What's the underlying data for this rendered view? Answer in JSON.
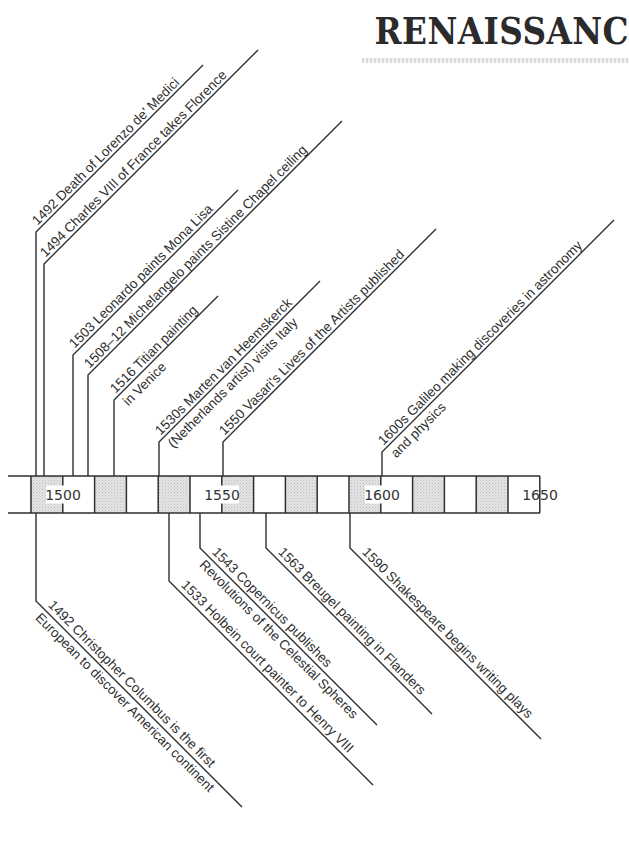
{
  "header": {
    "title": "RENAISSANC"
  },
  "timeline": {
    "start_x": 8,
    "end_x": 540,
    "top": 476,
    "bottom": 513,
    "cell_width": 31.8,
    "shaded_cells": [
      1,
      3,
      5,
      7,
      9,
      11,
      13,
      15
    ],
    "year_labels": [
      {
        "text": "1500",
        "x": 63
      },
      {
        "text": "1550",
        "x": 222
      },
      {
        "text": "1600",
        "x": 382
      },
      {
        "text": "1650",
        "x": 540
      }
    ]
  },
  "events_above": [
    {
      "x": 36,
      "elbow_y": 232,
      "end_x": 203,
      "lines": [
        "1492 Death of Lorenzo de' Medici"
      ]
    },
    {
      "x": 44,
      "elbow_y": 264,
      "end_x": 258,
      "lines": [
        "1494 Charles VIII of France takes Florence"
      ]
    },
    {
      "x": 73,
      "elbow_y": 355,
      "end_x": 238,
      "lines": [
        "1503 Leonardo paints Mona Lisa"
      ]
    },
    {
      "x": 88,
      "elbow_y": 375,
      "end_x": 342,
      "lines": [
        "1508–12 Michelangelo paints Sistine Chapel ceiling"
      ]
    },
    {
      "x": 114,
      "elbow_y": 400,
      "end_x": 218,
      "lines": [
        "1516 Titian painting",
        "in Venice"
      ]
    },
    {
      "x": 159,
      "elbow_y": 442,
      "end_x": 320,
      "lines": [
        "1530s Marten van Heemskerck",
        "(Netherlands artist) visits Italy"
      ]
    },
    {
      "x": 223,
      "elbow_y": 442,
      "end_x": 436,
      "lines": [
        "1550 Vasari's Lives of the Artists published"
      ]
    },
    {
      "x": 382,
      "elbow_y": 452,
      "end_x": 614,
      "lines": [
        "1600s Galileo making discoveries in astronomy",
        "and physics"
      ]
    }
  ],
  "events_below": [
    {
      "x": 36,
      "elbow_y": 601,
      "end_x": 242,
      "lines": [
        "1492 Christopher Columbus is the first",
        "European to discover American continent"
      ]
    },
    {
      "x": 169,
      "elbow_y": 581,
      "end_x": 373,
      "lines": [
        "1533 Holbein court painter to Henry VIII"
      ]
    },
    {
      "x": 200,
      "elbow_y": 548,
      "end_x": 377,
      "lines": [
        "1543 Copernicus publishes",
        "Revolutions of the Celestial Spheres"
      ]
    },
    {
      "x": 266,
      "elbow_y": 548,
      "end_x": 432,
      "lines": [
        "1563 Breugel painting in Flanders"
      ]
    },
    {
      "x": 350,
      "elbow_y": 548,
      "end_x": 541,
      "lines": [
        "1590 Shakespeare begins writing plays"
      ]
    }
  ],
  "colors": {
    "line": "#2e2e2e",
    "shade": "#d9d9d9"
  }
}
